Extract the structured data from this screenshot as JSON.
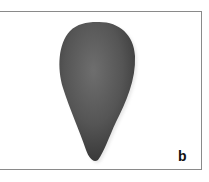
{
  "figure": {
    "panel_label": "b",
    "colors": {
      "background": "#ffffff",
      "border": "#8a8a8a",
      "object_dark": "#3c3c3c",
      "object_mid": "#5a5a5a",
      "object_light": "#6e6e6e"
    }
  }
}
